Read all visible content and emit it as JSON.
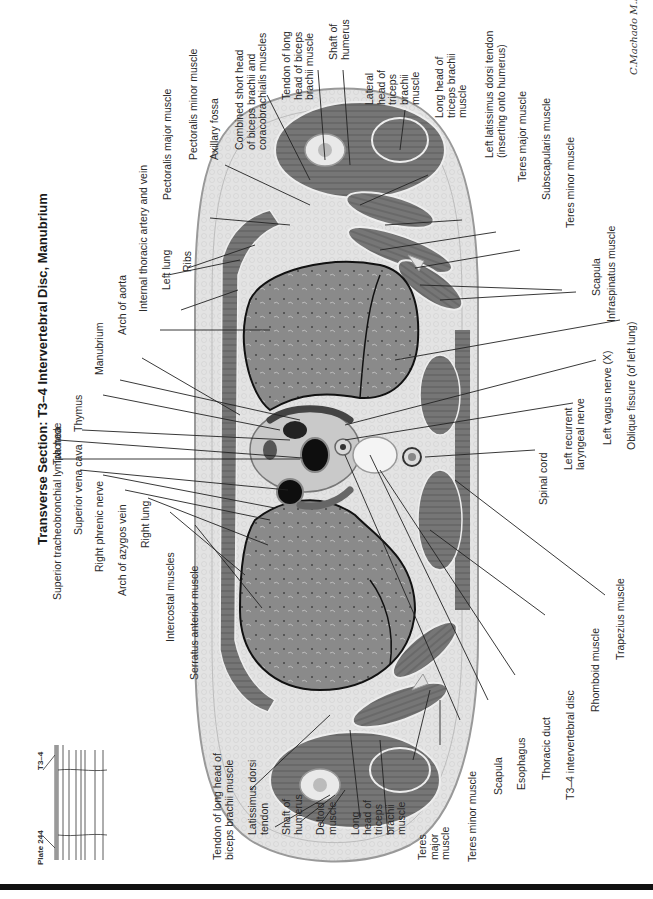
{
  "plate": {
    "number_label": "Plate 244",
    "level_label": "T3–4",
    "title": "Transverse Section: T3–4 Intervertebral Disc, Manubrium",
    "signature": "C.Machado M.D."
  },
  "labels": {
    "upper": [
      {
        "id": "superior-tracheobronchial-lymph-node",
        "text": "Superior tracheobronchial lymph node"
      },
      {
        "id": "superior-vena-cava",
        "text": "Superior vena cava"
      },
      {
        "id": "right-phrenic-nerve",
        "text": "Right phrenic nerve"
      },
      {
        "id": "arch-of-azygos-vein",
        "text": "Arch of azygos vein"
      },
      {
        "id": "right-lung",
        "text": "Right lung"
      },
      {
        "id": "intercostal-muscles",
        "text": "Intercostal muscles"
      },
      {
        "id": "serratus-anterior-muscle",
        "text": "Serratus anterior muscle"
      },
      {
        "id": "trachea",
        "text": "Trachea"
      },
      {
        "id": "thymus",
        "text": "Thymus"
      },
      {
        "id": "manubrium",
        "text": "Manubrium"
      },
      {
        "id": "arch-of-aorta",
        "text": "Arch of aorta"
      },
      {
        "id": "internal-thoracic-artery-and-vein",
        "text": "Internal thoracic artery and vein"
      },
      {
        "id": "left-lung",
        "text": "Left lung"
      },
      {
        "id": "ribs",
        "text": "Ribs"
      },
      {
        "id": "pectoralis-major-muscle",
        "text": "Pectoralis major muscle"
      },
      {
        "id": "pectoralis-minor-muscle",
        "text": "Pectoralis minor muscle"
      },
      {
        "id": "axillary-fossa",
        "text": "Axillary fossa"
      },
      {
        "id": "combined-short-head",
        "text": "Combined short head\nof biceps brachii and\ncoracobrachialis muscles"
      },
      {
        "id": "tendon-long-head-biceps-left",
        "text": "Tendon of long\nhead of biceps\nbrachii muscle"
      },
      {
        "id": "shaft-of-humerus-left",
        "text": "Shaft of\nhumerus"
      },
      {
        "id": "lateral-head-triceps",
        "text": "Lateral\nhead of\ntriceps\nbrachii\nmuscle"
      },
      {
        "id": "long-head-triceps-left",
        "text": "Long head of\ntriceps brachii\nmuscle"
      },
      {
        "id": "left-latissimus-dorsi-tendon",
        "text": "Left latissimus dorsi tendon\n(inserting onto humerus)"
      },
      {
        "id": "teres-major-muscle-left",
        "text": "Teres major muscle"
      },
      {
        "id": "subscapularis-muscle",
        "text": "Subscapularis muscle"
      },
      {
        "id": "teres-minor-muscle-left",
        "text": "Teres minor muscle"
      },
      {
        "id": "scapula-left",
        "text": "Scapula"
      },
      {
        "id": "infraspinatus-muscle",
        "text": "Infraspinatus muscle"
      },
      {
        "id": "oblique-fissure",
        "text": "Oblique fissure (of left lung)"
      },
      {
        "id": "left-vagus-nerve",
        "text": "Left vagus nerve (X)"
      },
      {
        "id": "left-recurrent-laryngeal-nerve",
        "text": "Left recurrent\nlaryngeal nerve"
      },
      {
        "id": "spinal-cord",
        "text": "Spinal cord"
      }
    ],
    "lower": [
      {
        "id": "tendon-long-head-biceps-right",
        "text": "Tendon of long head of\nbiceps brachii muscle"
      },
      {
        "id": "latissimus-dorsi-tendon",
        "text": "Latissimus dorsi\ntendon"
      },
      {
        "id": "shaft-of-humerus-right",
        "text": "Shaft of\nhumerus"
      },
      {
        "id": "deltoid-muscle",
        "text": "Deltoid\nmuscle"
      },
      {
        "id": "long-head-triceps-right",
        "text": "Long\nhead of\ntriceps\nbrachii\nmuscle"
      },
      {
        "id": "teres-major-muscle-right",
        "text": "Teres\nmajor\nmuscle"
      },
      {
        "id": "teres-minor-muscle-right",
        "text": "Teres minor muscle"
      },
      {
        "id": "scapula-right",
        "text": "Scapula"
      },
      {
        "id": "esophagus",
        "text": "Esophagus"
      },
      {
        "id": "thoracic-duct",
        "text": "Thoracic duct"
      },
      {
        "id": "t3-4-intervertebral-disc",
        "text": "T3–4 intervertebral disc"
      },
      {
        "id": "rhomboid-muscle",
        "text": "Rhomboid muscle"
      },
      {
        "id": "trapezius-muscle",
        "text": "Trapezius muscle"
      }
    ]
  },
  "colors": {
    "skin": "#d9d9d9",
    "fat": "#e8e8e8",
    "muscle": "#7a7a7a",
    "lung": "#8c8c8c",
    "vessel": "#1a1a1a",
    "bone": "#e6e6e6",
    "line": "#222222"
  }
}
